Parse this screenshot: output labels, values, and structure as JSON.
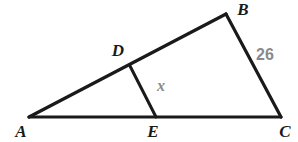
{
  "figure": {
    "type": "geometry-diagram",
    "background_color": "#ffffff",
    "stroke_color": "#1a1a1a",
    "label_color": "#1a1a1a",
    "measure_color": "#8a8a8a",
    "vertices": [
      {
        "id": "A",
        "label": "A",
        "x": 29,
        "y": 117,
        "label_x": 21,
        "label_y": 137
      },
      {
        "id": "B",
        "label": "B",
        "x": 226,
        "y": 14,
        "label_x": 243,
        "label_y": 15
      },
      {
        "id": "C",
        "label": "C",
        "x": 281,
        "y": 117,
        "label_x": 285,
        "label_y": 137
      },
      {
        "id": "D",
        "label": "D",
        "x": 130,
        "y": 66,
        "label_x": 118,
        "label_y": 56
      },
      {
        "id": "E",
        "label": "E",
        "x": 156,
        "y": 117,
        "label_x": 153,
        "label_y": 137
      }
    ],
    "segments": [
      {
        "id": "AB",
        "from": "A",
        "to": "B",
        "x1": 29,
        "y1": 117,
        "x2": 226,
        "y2": 14,
        "width": 3.2
      },
      {
        "id": "BC",
        "from": "B",
        "to": "C",
        "x1": 226,
        "y1": 14,
        "x2": 281,
        "y2": 117,
        "width": 3.2
      },
      {
        "id": "AC",
        "from": "A",
        "to": "C",
        "x1": 29,
        "y1": 117,
        "x2": 281,
        "y2": 117,
        "width": 3.2
      },
      {
        "id": "DE",
        "from": "D",
        "to": "E",
        "x1": 130,
        "y1": 66,
        "x2": 156,
        "y2": 117,
        "width": 3.0
      }
    ],
    "measures": [
      {
        "id": "BC-length",
        "text": "26",
        "applies_to": "BC",
        "x": 265,
        "y": 60
      },
      {
        "id": "DE-length",
        "text": "x",
        "applies_to": "DE",
        "x": 161,
        "y": 91
      }
    ]
  }
}
